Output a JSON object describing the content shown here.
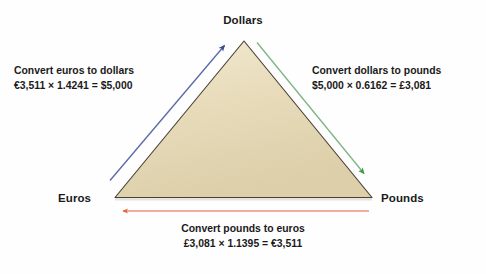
{
  "figure": {
    "type": "currency-conversion-triangle",
    "background_color": "#ffffff",
    "triangle": {
      "fill_color": "#e5d7b5",
      "stroke_color": "#4a4236"
    }
  },
  "vertices": {
    "top": "Dollars",
    "bottom_left": "Euros",
    "bottom_right": "Pounds"
  },
  "conversions": {
    "euros_to_dollars": {
      "title": "Convert euros to dollars",
      "equation": "€3,511 × 1.4241 = $5,000",
      "from": "Euros",
      "to": "Dollars",
      "amount_in": "€3,511",
      "rate": "1.4241",
      "amount_out": "$5,000",
      "arrow_color": "#4a5496",
      "arrow_direction": "up-right"
    },
    "dollars_to_pounds": {
      "title": "Convert dollars to pounds",
      "equation": "$5,000 × 0.6162 = £3,081",
      "from": "Dollars",
      "to": "Pounds",
      "amount_in": "$5,000",
      "rate": "0.6162",
      "amount_out": "£3,081",
      "arrow_color": "#4a9d4a",
      "arrow_direction": "down-right"
    },
    "pounds_to_euros": {
      "title": "Convert pounds to euros",
      "equation": "£3,081 × 1.1395 = €3,511",
      "from": "Pounds",
      "to": "Euros",
      "amount_in": "£3,081",
      "rate": "1.1395",
      "amount_out": "€3,511",
      "arrow_color": "#e2603c",
      "arrow_direction": "left"
    }
  }
}
